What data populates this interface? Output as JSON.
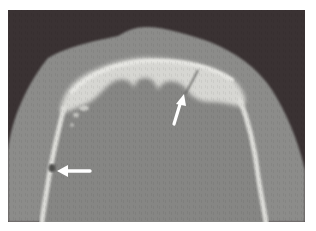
{
  "figure": {
    "kind": "axial CT scan, bone window",
    "subject": "skull vault cross-section",
    "colors": {
      "page_background": "#ffffff",
      "air_background": "#3a3233",
      "soft_tissue": "#8c8c8a",
      "brain": "#868684",
      "bone": "#d6d6d2",
      "bone_bright": "#e6e6e2",
      "arrow": "#ffffff"
    },
    "annotations": [
      {
        "id": "arrow-upper",
        "direction": "up-right",
        "description": "white arrow pointing to fracture line in frontal bone"
      },
      {
        "id": "arrow-left",
        "direction": "left",
        "description": "white arrow pointing to gap in left lateral skull wall"
      }
    ]
  }
}
